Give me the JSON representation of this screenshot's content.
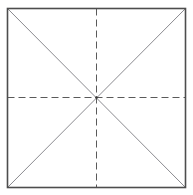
{
  "canvas": {
    "width": 193,
    "height": 195,
    "background_color": "#ffffff"
  },
  "diagram": {
    "square": {
      "name": "outer-square",
      "left": 7.5,
      "top": 8.5,
      "right": 185.5,
      "bottom": 187.5,
      "width": 178,
      "height": 179,
      "stroke_color": "#4d4d4d",
      "stroke_width": 1.6,
      "fill": "none",
      "line_style": "solid"
    },
    "center_point": {
      "name": "center-intersection",
      "x": 96.5,
      "y": 97.5,
      "marker_color": "#3a3a3a",
      "marker_radius": 1.3
    },
    "center_lines": [
      {
        "name": "vertical-center-line",
        "orientation": "vertical",
        "x1": 96.5,
        "y1": 8.5,
        "x2": 96.5,
        "y2": 187.5,
        "line_style": "dashed",
        "dash_pattern": "7 4",
        "stroke_color": "#5a5a5a",
        "stroke_width": 1.0
      },
      {
        "name": "horizontal-center-line",
        "orientation": "horizontal",
        "x1": 7.5,
        "y1": 97.5,
        "x2": 185.5,
        "y2": 97.5,
        "line_style": "dashed",
        "dash_pattern": "7 4",
        "stroke_color": "#5a5a5a",
        "stroke_width": 1.0
      }
    ],
    "diagonals": [
      {
        "name": "diagonal-top-left-to-bottom-right",
        "x1": 7.5,
        "y1": 8.5,
        "x2": 185.5,
        "y2": 187.5,
        "line_style": "solid",
        "stroke_color": "#7d7d82",
        "stroke_width": 0.9
      },
      {
        "name": "diagonal-top-right-to-bottom-left",
        "x1": 185.5,
        "y1": 8.5,
        "x2": 7.5,
        "y2": 187.5,
        "line_style": "solid",
        "stroke_color": "#7d7d82",
        "stroke_width": 0.9
      }
    ],
    "labels": [],
    "ray_count": 8
  }
}
